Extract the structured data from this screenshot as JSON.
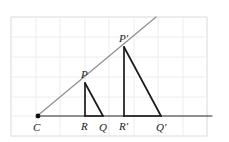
{
  "figure": {
    "type": "geometry-diagram",
    "canvas": {
      "width": 229,
      "height": 142,
      "background": "#ffffff"
    },
    "colors": {
      "grid_line": "#ececee",
      "grid_border": "#e4e4e6",
      "ray": "#8d8d93",
      "segment": "#1a1a1a",
      "baseline": "#2b2b2b",
      "label_text": "#1a1a1a",
      "center_dot": "#111111"
    },
    "grid": {
      "visible": true,
      "x_lines": [
        11,
        36,
        60,
        85,
        109,
        134,
        158,
        183,
        207
      ],
      "y_lines": [
        17,
        37,
        57,
        77,
        97,
        116,
        136
      ],
      "border": {
        "x": 11,
        "y": 17,
        "width": 196,
        "height": 119
      }
    },
    "baseline": {
      "x1": 38,
      "y1": 116,
      "x2": 212,
      "y2": 116
    },
    "ray": {
      "x1": 36,
      "y1": 117,
      "x2": 156,
      "y2": 17
    },
    "points": [
      {
        "name": "C",
        "label": "C",
        "x": 38,
        "y": 116,
        "label_x": 33,
        "label_y": 131,
        "dot": true
      },
      {
        "name": "R",
        "label": "R",
        "x": 85,
        "y": 116,
        "label_x": 81,
        "label_y": 130,
        "dot": false
      },
      {
        "name": "Q",
        "label": "Q",
        "x": 103,
        "y": 116,
        "label_x": 99,
        "label_y": 131,
        "dot": false
      },
      {
        "name": "P",
        "label": "P",
        "x": 85,
        "y": 83,
        "label_x": 81,
        "label_y": 78,
        "dot": false
      },
      {
        "name": "R'",
        "label": "R′",
        "x": 124,
        "y": 116,
        "label_x": 119,
        "label_y": 130,
        "dot": false
      },
      {
        "name": "Q'",
        "label": "Q′",
        "x": 161,
        "y": 116,
        "label_x": 156,
        "label_y": 131,
        "dot": false
      },
      {
        "name": "P'",
        "label": "P′",
        "x": 124,
        "y": 47,
        "label_x": 119,
        "label_y": 42,
        "dot": false
      }
    ],
    "triangles": [
      {
        "name": "small-triangle-PRQ",
        "vertices": "P,R,Q",
        "segments": [
          {
            "name": "segment-P-R",
            "x1": 85,
            "y1": 83,
            "x2": 85,
            "y2": 116
          },
          {
            "name": "segment-P-Q",
            "x1": 85,
            "y1": 83,
            "x2": 103,
            "y2": 116
          },
          {
            "name": "segment-R-Q",
            "x1": 85,
            "y1": 116,
            "x2": 103,
            "y2": 116
          }
        ]
      },
      {
        "name": "large-triangle-PRQ-prime",
        "vertices": "P',R',Q'",
        "segments": [
          {
            "name": "segment-Pprime-Rprime",
            "x1": 124,
            "y1": 47,
            "x2": 124,
            "y2": 116
          },
          {
            "name": "segment-Pprime-Qprime",
            "x1": 124,
            "y1": 47,
            "x2": 161,
            "y2": 116
          },
          {
            "name": "segment-Rprime-Qprime",
            "x1": 124,
            "y1": 116,
            "x2": 161,
            "y2": 116
          }
        ]
      }
    ]
  }
}
